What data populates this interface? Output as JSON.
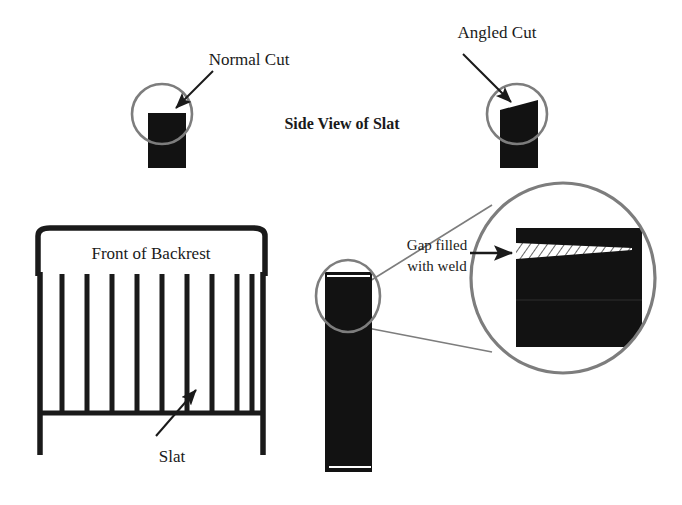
{
  "figure": {
    "title": "Side View of Slat",
    "background_color": "#ffffff",
    "ink_color": "#1a1a1a",
    "fill_color": "#121212",
    "circle_color": "#7d7d7d",
    "weld_hatch_color": "#555555"
  },
  "labels": {
    "normal_cut": "Normal Cut",
    "angled_cut": "Angled Cut",
    "side_view_title": "Side View of Slat",
    "front_of_backrest": "Front of Backrest",
    "slat": "Slat",
    "gap_filled_line1": "Gap filled",
    "gap_filled_line2": "with weld"
  },
  "backrest": {
    "slat_count": 9,
    "frame_label": "Front of Backrest",
    "callout_label": "Slat"
  },
  "detail": {
    "callout_label_line1": "Gap filled",
    "callout_label_line2": "with weld",
    "weld_description": "tapered hatched wedge at top of slat joint"
  },
  "cuts": [
    {
      "name": "Normal Cut",
      "top_edge": "flat"
    },
    {
      "name": "Angled Cut",
      "top_edge": "sloped-up-right"
    }
  ]
}
